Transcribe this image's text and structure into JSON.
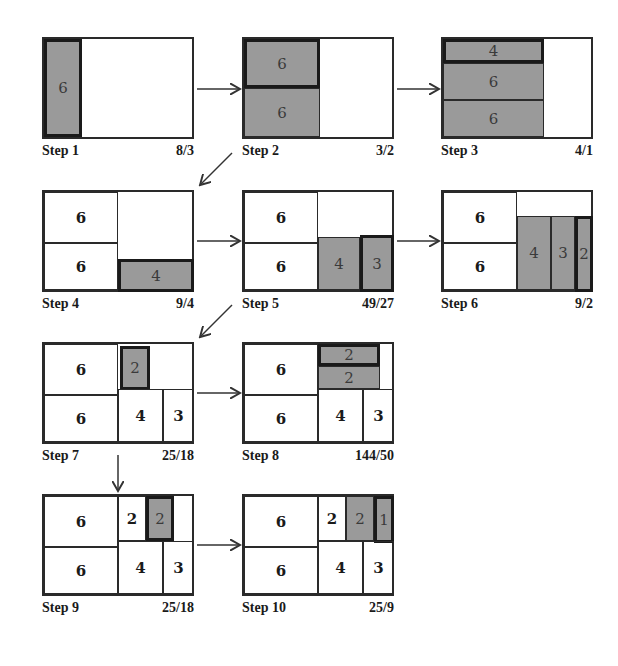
{
  "colors": {
    "shaded": "#9a9a9a",
    "border": "#2a2a2a",
    "background": "#ffffff"
  },
  "steps": [
    {
      "label": "Step 1",
      "ratio": "8/3",
      "cells": [
        {
          "value": "6",
          "x": 0,
          "y": 0,
          "w": 38,
          "h": 98,
          "shaded": true,
          "active": true
        }
      ]
    },
    {
      "label": "Step 2",
      "ratio": "3/2",
      "cells": [
        {
          "value": "6",
          "x": 0,
          "y": 0,
          "w": 76,
          "h": 49,
          "shaded": true,
          "active": true
        },
        {
          "value": "6",
          "x": 0,
          "y": 49,
          "w": 76,
          "h": 49,
          "shaded": true,
          "active": false
        }
      ]
    },
    {
      "label": "Step 3",
      "ratio": "4/1",
      "cells": [
        {
          "value": "4",
          "x": 0,
          "y": 0,
          "w": 101,
          "h": 24,
          "shaded": true,
          "active": true
        },
        {
          "value": "6",
          "x": 0,
          "y": 24,
          "w": 101,
          "h": 37,
          "shaded": true,
          "active": false
        },
        {
          "value": "6",
          "x": 0,
          "y": 61,
          "w": 101,
          "h": 37,
          "shaded": true,
          "active": false
        }
      ]
    },
    {
      "label": "Step 4",
      "ratio": "9/4",
      "cells": [
        {
          "value": "6",
          "x": 0,
          "y": 0,
          "w": 74,
          "h": 51,
          "shaded": false,
          "active": false
        },
        {
          "value": "6",
          "x": 0,
          "y": 51,
          "w": 74,
          "h": 47,
          "shaded": false,
          "active": false
        },
        {
          "value": "4",
          "x": 74,
          "y": 67,
          "w": 76,
          "h": 33,
          "shaded": true,
          "active": true
        }
      ]
    },
    {
      "label": "Step 5",
      "ratio": "49/27",
      "cells": [
        {
          "value": "6",
          "x": 0,
          "y": 0,
          "w": 74,
          "h": 51,
          "shaded": false,
          "active": false
        },
        {
          "value": "6",
          "x": 0,
          "y": 51,
          "w": 74,
          "h": 47,
          "shaded": false,
          "active": false
        },
        {
          "value": "4",
          "x": 74,
          "y": 45,
          "w": 42,
          "h": 53,
          "shaded": true,
          "active": false
        },
        {
          "value": "3",
          "x": 116,
          "y": 43,
          "w": 34,
          "h": 57,
          "shaded": true,
          "active": true
        }
      ]
    },
    {
      "label": "Step 6",
      "ratio": "9/2",
      "cells": [
        {
          "value": "6",
          "x": 0,
          "y": 0,
          "w": 74,
          "h": 51,
          "shaded": false,
          "active": false
        },
        {
          "value": "6",
          "x": 0,
          "y": 51,
          "w": 74,
          "h": 47,
          "shaded": false,
          "active": false
        },
        {
          "value": "4",
          "x": 74,
          "y": 24,
          "w": 34,
          "h": 74,
          "shaded": true,
          "active": false
        },
        {
          "value": "3",
          "x": 108,
          "y": 24,
          "w": 24,
          "h": 74,
          "shaded": true,
          "active": false
        },
        {
          "value": "2",
          "x": 132,
          "y": 24,
          "w": 18,
          "h": 76,
          "shaded": true,
          "active": true
        }
      ]
    },
    {
      "label": "Step 7",
      "ratio": "25/18",
      "cells": [
        {
          "value": "6",
          "x": 0,
          "y": 0,
          "w": 74,
          "h": 51,
          "shaded": false,
          "active": false
        },
        {
          "value": "6",
          "x": 0,
          "y": 51,
          "w": 74,
          "h": 47,
          "shaded": false,
          "active": false
        },
        {
          "value": "2",
          "x": 76,
          "y": 2,
          "w": 30,
          "h": 44,
          "shaded": true,
          "active": true
        },
        {
          "value": "4",
          "x": 74,
          "y": 45,
          "w": 45,
          "h": 53,
          "shaded": false,
          "active": false
        },
        {
          "value": "3",
          "x": 119,
          "y": 45,
          "w": 31,
          "h": 53,
          "shaded": false,
          "active": false
        }
      ]
    },
    {
      "label": "Step 8",
      "ratio": "144/50",
      "cells": [
        {
          "value": "6",
          "x": 0,
          "y": 0,
          "w": 74,
          "h": 51,
          "shaded": false,
          "active": false
        },
        {
          "value": "6",
          "x": 0,
          "y": 51,
          "w": 74,
          "h": 47,
          "shaded": false,
          "active": false
        },
        {
          "value": "2",
          "x": 74,
          "y": 0,
          "w": 62,
          "h": 22,
          "shaded": true,
          "active": true
        },
        {
          "value": "2",
          "x": 74,
          "y": 22,
          "w": 62,
          "h": 23,
          "shaded": true,
          "active": false
        },
        {
          "value": "4",
          "x": 74,
          "y": 45,
          "w": 45,
          "h": 53,
          "shaded": false,
          "active": false
        },
        {
          "value": "3",
          "x": 119,
          "y": 45,
          "w": 31,
          "h": 53,
          "shaded": false,
          "active": false
        }
      ]
    },
    {
      "label": "Step 9",
      "ratio": "25/18",
      "cells": [
        {
          "value": "6",
          "x": 0,
          "y": 0,
          "w": 74,
          "h": 51,
          "shaded": false,
          "active": false
        },
        {
          "value": "6",
          "x": 0,
          "y": 51,
          "w": 74,
          "h": 47,
          "shaded": false,
          "active": false
        },
        {
          "value": "2",
          "x": 74,
          "y": 0,
          "w": 28,
          "h": 45,
          "shaded": false,
          "active": false
        },
        {
          "value": "2",
          "x": 102,
          "y": 0,
          "w": 28,
          "h": 45,
          "shaded": true,
          "active": true
        },
        {
          "value": "4",
          "x": 74,
          "y": 45,
          "w": 45,
          "h": 53,
          "shaded": false,
          "active": false
        },
        {
          "value": "3",
          "x": 119,
          "y": 45,
          "w": 31,
          "h": 53,
          "shaded": false,
          "active": false
        }
      ]
    },
    {
      "label": "Step 10",
      "ratio": "25/9",
      "cells": [
        {
          "value": "6",
          "x": 0,
          "y": 0,
          "w": 74,
          "h": 51,
          "shaded": false,
          "active": false
        },
        {
          "value": "6",
          "x": 0,
          "y": 51,
          "w": 74,
          "h": 47,
          "shaded": false,
          "active": false
        },
        {
          "value": "2",
          "x": 74,
          "y": 0,
          "w": 28,
          "h": 45,
          "shaded": false,
          "active": false
        },
        {
          "value": "2",
          "x": 102,
          "y": 0,
          "w": 28,
          "h": 45,
          "shaded": true,
          "active": false
        },
        {
          "value": "1",
          "x": 130,
          "y": 0,
          "w": 20,
          "h": 47,
          "shaded": true,
          "active": true
        },
        {
          "value": "4",
          "x": 74,
          "y": 45,
          "w": 45,
          "h": 53,
          "shaded": false,
          "active": false
        },
        {
          "value": "3",
          "x": 119,
          "y": 45,
          "w": 31,
          "h": 53,
          "shaded": false,
          "active": false
        }
      ]
    }
  ],
  "positions": [
    [
      42,
      37
    ],
    [
      242,
      37
    ],
    [
      441,
      37
    ],
    [
      42,
      190
    ],
    [
      242,
      190
    ],
    [
      441,
      190
    ],
    [
      42,
      342
    ],
    [
      242,
      342
    ],
    [
      42,
      494
    ],
    [
      242,
      494
    ]
  ],
  "arrows": [
    {
      "from": "Step 1",
      "to": "Step 2",
      "x1": 197,
      "y1": 89,
      "x2": 240,
      "y2": 89
    },
    {
      "from": "Step 2",
      "to": "Step 3",
      "x1": 397,
      "y1": 89,
      "x2": 439,
      "y2": 89
    },
    {
      "from": "Step 2",
      "to": "Step 4",
      "x1": 232,
      "y1": 153,
      "x2": 200,
      "y2": 185
    },
    {
      "from": "Step 4",
      "to": "Step 5",
      "x1": 197,
      "y1": 241,
      "x2": 240,
      "y2": 241
    },
    {
      "from": "Step 5",
      "to": "Step 6",
      "x1": 397,
      "y1": 241,
      "x2": 439,
      "y2": 241
    },
    {
      "from": "Step 5",
      "to": "Step 7",
      "x1": 232,
      "y1": 305,
      "x2": 200,
      "y2": 337
    },
    {
      "from": "Step 7",
      "to": "Step 8",
      "x1": 197,
      "y1": 393,
      "x2": 240,
      "y2": 393
    },
    {
      "from": "Step 7",
      "to": "Step 9",
      "x1": 118,
      "y1": 455,
      "x2": 118,
      "y2": 491
    },
    {
      "from": "Step 9",
      "to": "Step 10",
      "x1": 197,
      "y1": 545,
      "x2": 240,
      "y2": 545
    }
  ]
}
